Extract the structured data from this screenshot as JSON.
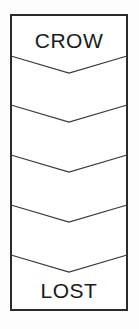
{
  "figure": {
    "title_top": "CROW",
    "title_bottom": "LOST",
    "colors": {
      "panel_background": "#ffffff",
      "panel_border": "#2b2b2b",
      "chevron_line": "#3a3a3a",
      "label_text": "#1a1a1a",
      "page_background": "#fdfdfd"
    },
    "panel": {
      "left": 10,
      "top": 14,
      "right": 128,
      "bottom": 311,
      "border_width": 2
    },
    "chevrons": {
      "count": 5,
      "direction": "down",
      "apex_x": 69,
      "drop": 17,
      "edge_y_values": [
        56,
        105,
        155,
        205,
        255
      ]
    },
    "labels": {
      "top": {
        "text": "CROW",
        "x": 69,
        "y": 48,
        "font_size": 21
      },
      "bottom": {
        "text": "LOST",
        "x": 69,
        "y": 298,
        "font_size": 21
      }
    },
    "bands": [
      {
        "index": 1,
        "label": "CROW"
      },
      {
        "index": 2,
        "label": ""
      },
      {
        "index": 3,
        "label": ""
      },
      {
        "index": 4,
        "label": ""
      },
      {
        "index": 5,
        "label": ""
      },
      {
        "index": 6,
        "label": "LOST"
      }
    ]
  }
}
